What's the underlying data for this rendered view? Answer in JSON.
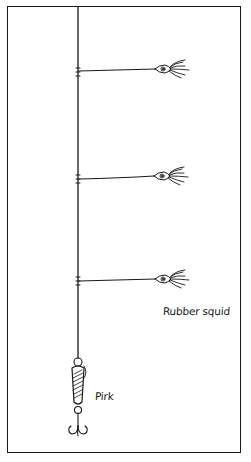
{
  "figure": {
    "type": "fishing-rig-illustration",
    "labels": {
      "rubber_squid": "Rubber squid",
      "pirk": "Pirk"
    },
    "components": [
      {
        "name": "main-line",
        "count": 1
      },
      {
        "name": "rubber-squid-dropper",
        "count": 3
      },
      {
        "name": "pirk",
        "count": 1
      },
      {
        "name": "treble-hook",
        "count": 1
      }
    ],
    "colors": {
      "ink": "#1a1a1a",
      "background": "#ffffff"
    }
  }
}
